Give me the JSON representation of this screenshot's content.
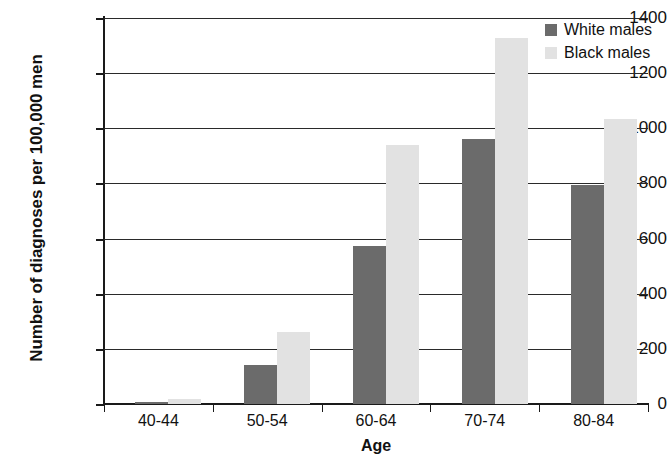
{
  "chart_data": {
    "type": "bar",
    "title": "",
    "xlabel": "Age",
    "ylabel": "Number of diagnoses per 100,000 men",
    "categories": [
      "40-44",
      "50-54",
      "60-64",
      "70-74",
      "80-84"
    ],
    "series": [
      {
        "name": "White males",
        "color": "#6b6b6b",
        "values": [
          8,
          140,
          573,
          960,
          793
        ]
      },
      {
        "name": "Black males",
        "color": "#e2e2e2",
        "values": [
          20,
          260,
          938,
          1327,
          1033
        ]
      }
    ],
    "ylim": [
      0,
      1400
    ],
    "ytick_labels": [
      "1400",
      "1200",
      "1000",
      "800",
      "600",
      "400",
      "200",
      "0"
    ],
    "ytick_values": [
      1400,
      1200,
      1000,
      800,
      600,
      400,
      200,
      0
    ],
    "grid": "horizontal",
    "legend_position": "top-right"
  },
  "legend": {
    "entries": [
      {
        "label": "White males"
      },
      {
        "label": "Black males"
      }
    ]
  },
  "axes": {
    "x_title": "Age",
    "y_title": "Number of diagnoses per 100,000 men"
  }
}
